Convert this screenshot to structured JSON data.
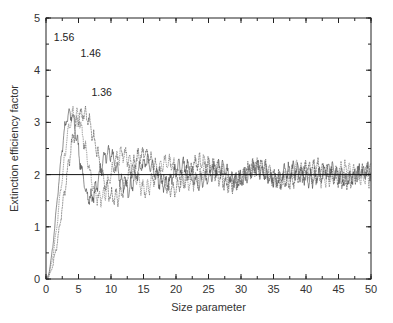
{
  "chart_data": {
    "type": "line",
    "title": "",
    "xlabel": "Size parameter",
    "ylabel": "Extinction efficiency factor",
    "xlim": [
      0,
      50
    ],
    "ylim": [
      0,
      5
    ],
    "x_ticks": [
      0,
      5,
      10,
      15,
      20,
      25,
      30,
      35,
      40,
      45,
      50
    ],
    "y_ticks": [
      0,
      1,
      2,
      3,
      4,
      5
    ],
    "x_minor_step": 2.5,
    "y_minor_step": 0.5,
    "grid": false,
    "legend": "none (inline labels near peaks)",
    "reference_line": {
      "y": 2,
      "label": ""
    },
    "series": [
      {
        "name": "1.56",
        "refractive_index": 1.56,
        "first_peak": {
          "x": 3.5,
          "y": 4.45
        },
        "label_pos": {
          "x": 1.2,
          "y": 4.55
        }
      },
      {
        "name": "1.46",
        "refractive_index": 1.46,
        "first_peak": {
          "x": 4.2,
          "y": 4.25
        },
        "label_pos": {
          "x": 5.3,
          "y": 4.25
        }
      },
      {
        "name": "1.36",
        "refractive_index": 1.36,
        "first_peak": {
          "x": 5.8,
          "y": 4.05
        },
        "label_pos": {
          "x": 7.0,
          "y": 3.5
        }
      }
    ],
    "annotations": [
      "1.56",
      "1.46",
      "1.36"
    ]
  }
}
